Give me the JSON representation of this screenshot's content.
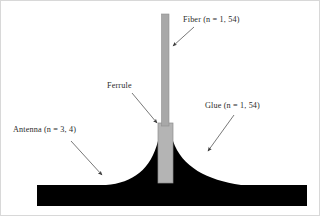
{
  "figure": {
    "background_color": "#ffffff",
    "border_color": "#d8d8d8",
    "width": 320,
    "height": 216
  },
  "colors": {
    "fiber_gray": "#a8a8a8",
    "ferrule_gray": "#b4b4b4",
    "glue_black": "#000000",
    "antenna_black": "#000000",
    "arrow_gray": "#555555",
    "text": "#2b2b2b"
  },
  "labels": {
    "fiber": "Fiber (n = 1, 54)",
    "ferrule": "Ferrule",
    "glue": "Glue (n = 1, 54)",
    "antenna": "Antenna (n = 3, 4)"
  },
  "components": [
    {
      "name": "fiber",
      "label": "Fiber (n = 1, 54)",
      "refractive_index": "n = 1, 54",
      "shape": "vertical-bar",
      "fill": "#a8a8a8"
    },
    {
      "name": "ferrule",
      "label": "Ferrule",
      "refractive_index": "",
      "shape": "vertical-rectangle",
      "fill": "#b4b4b4"
    },
    {
      "name": "glue",
      "label": "Glue (n = 1, 54)",
      "refractive_index": "n = 1, 54",
      "shape": "concave-mound",
      "fill": "#000000"
    },
    {
      "name": "antenna",
      "label": "Antenna (n = 3, 4)",
      "refractive_index": "n = 3, 4",
      "shape": "horizontal-slab",
      "fill": "#000000"
    }
  ],
  "annotations": [
    {
      "name": "fiber-arrow",
      "from": [
        193,
        26
      ],
      "to": [
        170,
        47
      ]
    },
    {
      "name": "ferrule-arrow",
      "from": [
        131,
        92
      ],
      "to": [
        158,
        124
      ]
    },
    {
      "name": "glue-arrow",
      "from": [
        233,
        114
      ],
      "to": [
        205,
        152
      ]
    },
    {
      "name": "antenna-arrow",
      "from": [
        70,
        140
      ],
      "to": [
        103,
        176
      ]
    }
  ]
}
